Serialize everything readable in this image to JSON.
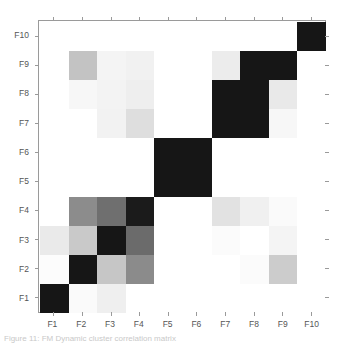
{
  "figure": {
    "caption": "Figure 11: FM Dynamic cluster correlation matrix"
  },
  "chart_data": {
    "type": "heatmap",
    "title": "",
    "xlabel": "",
    "ylabel": "",
    "grid": false,
    "legend": "none",
    "x_tick_labels": [
      "F1",
      "F2",
      "F3",
      "F4",
      "F5",
      "F6",
      "F7",
      "F8",
      "F9",
      "F10"
    ],
    "y_tick_labels": [
      "F1",
      "F2",
      "F3",
      "F4",
      "F5",
      "F6",
      "F7",
      "F8",
      "F9",
      "F10"
    ],
    "y_tick_labels_top_to_bottom": [
      "F10",
      "F9",
      "F8",
      "F7",
      "F6",
      "F5",
      "F4",
      "F3",
      "F2",
      "F1"
    ],
    "colormap": "greys",
    "colormap_low_color": "#ffffff",
    "colormap_high_color": "#000000",
    "vmin": 0,
    "vmax": 1,
    "rows": [
      "F1",
      "F2",
      "F3",
      "F4",
      "F5",
      "F6",
      "F7",
      "F8",
      "F9",
      "F10"
    ],
    "columns": [
      "F1",
      "F2",
      "F3",
      "F4",
      "F5",
      "F6",
      "F7",
      "F8",
      "F9",
      "F10"
    ],
    "values": [
      [
        1.0,
        0.06,
        0.14,
        0.02,
        0.0,
        0.0,
        0.0,
        0.0,
        0.0,
        0.0
      ],
      [
        0.02,
        1.0,
        0.3,
        0.52,
        0.0,
        0.0,
        0.0,
        0.0,
        0.22,
        0.0
      ],
      [
        0.18,
        0.32,
        1.0,
        0.62,
        0.0,
        0.0,
        0.03,
        0.0,
        0.06,
        0.0
      ],
      [
        0.02,
        0.52,
        0.62,
        1.0,
        0.0,
        0.0,
        0.2,
        0.08,
        0.04,
        0.0
      ],
      [
        0.0,
        0.0,
        0.0,
        0.0,
        1.0,
        1.0,
        0.0,
        0.0,
        0.0,
        0.0
      ],
      [
        0.0,
        0.0,
        0.0,
        0.0,
        1.0,
        1.0,
        0.0,
        0.0,
        0.0,
        0.0
      ],
      [
        0.0,
        0.0,
        0.03,
        0.2,
        0.0,
        0.0,
        1.0,
        1.0,
        0.12,
        0.0
      ],
      [
        0.0,
        0.0,
        0.06,
        0.08,
        0.0,
        0.0,
        1.0,
        1.0,
        0.12,
        0.0
      ],
      [
        0.0,
        0.22,
        0.06,
        0.04,
        0.0,
        0.0,
        0.12,
        1.0,
        1.0,
        0.0
      ],
      [
        0.0,
        0.0,
        0.0,
        0.0,
        0.0,
        0.0,
        0.0,
        0.0,
        0.0,
        1.0
      ]
    ],
    "cell_colors_top_to_bottom": [
      [
        "#ffffff",
        "#ffffff",
        "#ffffff",
        "#ffffff",
        "#ffffff",
        "#ffffff",
        "#ffffff",
        "#ffffff",
        "#ffffff",
        "#161616"
      ],
      [
        "#ffffff",
        "#c3c3c3",
        "#f4f4f4",
        "#f1f1f1",
        "#ffffff",
        "#ffffff",
        "#ececec",
        "#161616",
        "#161616",
        "#ffffff"
      ],
      [
        "#ffffff",
        "#f7f7f7",
        "#f3f3f3",
        "#eeeeee",
        "#ffffff",
        "#ffffff",
        "#161616",
        "#161616",
        "#e9e9e9",
        "#ffffff"
      ],
      [
        "#ffffff",
        "#ffffff",
        "#f2f2f2",
        "#dedede",
        "#ffffff",
        "#ffffff",
        "#161616",
        "#161616",
        "#f7f7f7",
        "#ffffff"
      ],
      [
        "#ffffff",
        "#ffffff",
        "#ffffff",
        "#ffffff",
        "#161616",
        "#161616",
        "#ffffff",
        "#ffffff",
        "#ffffff",
        "#ffffff"
      ],
      [
        "#ffffff",
        "#ffffff",
        "#ffffff",
        "#ffffff",
        "#161616",
        "#161616",
        "#ffffff",
        "#ffffff",
        "#ffffff",
        "#ffffff"
      ],
      [
        "#ffffff",
        "#8c8c8c",
        "#6f6f6f",
        "#1b1b1b",
        "#ffffff",
        "#ffffff",
        "#e2e2e2",
        "#f0f0f0",
        "#fafafa",
        "#ffffff"
      ],
      [
        "#eaeaea",
        "#c9c9c9",
        "#161616",
        "#6b6b6b",
        "#ffffff",
        "#ffffff",
        "#fbfbfb",
        "#ffffff",
        "#f4f4f4",
        "#ffffff"
      ],
      [
        "#fcfcfc",
        "#161616",
        "#c6c6c6",
        "#8b8b8b",
        "#ffffff",
        "#ffffff",
        "#ffffff",
        "#fbfbfb",
        "#cccccc",
        "#ffffff"
      ],
      [
        "#161616",
        "#fafafa",
        "#efefef",
        "#ffffff",
        "#ffffff",
        "#ffffff",
        "#ffffff",
        "#ffffff",
        "#ffffff",
        "#ffffff"
      ]
    ]
  },
  "axes": {
    "tick_color": "#9a9a9a",
    "frame_color": "#9a9a9a",
    "label_color": "#555555"
  }
}
